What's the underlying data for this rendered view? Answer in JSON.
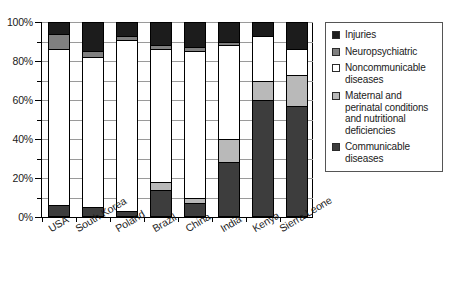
{
  "chart_data": {
    "type": "bar",
    "subtype": "stacked-percentage",
    "title": "",
    "xlabel": "",
    "ylabel": "",
    "ylim": [
      0,
      100
    ],
    "ytick_labels": [
      "0%",
      "20%",
      "40%",
      "60%",
      "80%",
      "100%"
    ],
    "ytick_values": [
      0,
      20,
      40,
      60,
      80,
      100
    ],
    "yminor_step": 5,
    "grid": true,
    "legend_position": "right",
    "categories": [
      "USA",
      "South Korea",
      "Poland",
      "Brazil",
      "China",
      "India",
      "Kenya",
      "Sierra Leone"
    ],
    "series": [
      {
        "name": "Communicable diseases",
        "color": "#3d3d3d",
        "values": [
          6,
          5,
          3,
          14,
          7,
          28,
          60,
          57
        ]
      },
      {
        "name": "Maternal and perinatal conditions and nutritional deficiencies",
        "color": "#b9b9b9",
        "values": [
          0,
          0,
          0,
          4,
          3,
          12,
          10,
          16
        ]
      },
      {
        "name": "Noncommunicable diseases",
        "color": "#ffffff",
        "values": [
          80,
          77,
          88,
          68,
          75,
          48,
          23,
          13
        ]
      },
      {
        "name": "Neuropsychiatric",
        "color": "#808080",
        "values": [
          8,
          3,
          2,
          2,
          2,
          2,
          0,
          0
        ]
      },
      {
        "name": "Injuries",
        "color": "#1c1c1c",
        "values": [
          6,
          15,
          7,
          12,
          13,
          10,
          7,
          14
        ]
      }
    ],
    "legend_entries": [
      {
        "label": "Injuries",
        "color": "#1c1c1c",
        "swatch": "filled-dark"
      },
      {
        "label": "Neuropsychiatric",
        "color": "#808080",
        "swatch": "filled-gray"
      },
      {
        "label": "Noncommunicable diseases",
        "color": "#ffffff",
        "swatch": "empty-white"
      },
      {
        "label": "Maternal and perinatal conditions and nutritional deficiencies",
        "color": "#b9b9b9",
        "swatch": "filled-lightgray"
      },
      {
        "label": "Communicable diseases",
        "color": "#3d3d3d",
        "swatch": "filled-darkgray"
      }
    ]
  },
  "axis": {
    "y_labels": [
      "100%",
      "80%",
      "60%",
      "40%",
      "20%",
      "0%"
    ]
  }
}
